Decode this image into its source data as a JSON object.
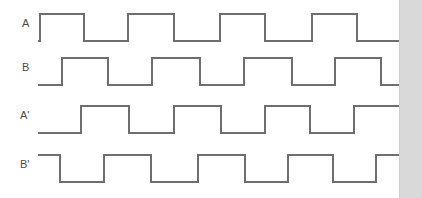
{
  "figure": {
    "type": "timing-diagram",
    "width": 422,
    "height": 198,
    "background_color": "#ffffff",
    "trace_color": "#6e6e6e",
    "label_color": "#4a4a4a",
    "right_strip_color": "#d9d9d9"
  },
  "labels": {
    "a": "A",
    "b": "B",
    "a_prime": "A'",
    "b_prime": "B'"
  },
  "chart_data": {
    "type": "line",
    "title": "",
    "xlabel": "",
    "ylabel": "",
    "grid": false,
    "legend": "none",
    "x_range": [
      38,
      403
    ],
    "signals": [
      {
        "name": "A",
        "label": "A",
        "row": 0,
        "baseline_y": 41,
        "high_y": 14,
        "start_level": "low",
        "end_level": "low",
        "transitions": [
          40,
          84,
          128,
          174,
          220,
          265,
          312,
          357
        ],
        "pulses": [
          [
            40,
            84
          ],
          [
            128,
            174
          ],
          [
            220,
            265
          ],
          [
            312,
            357
          ]
        ]
      },
      {
        "name": "B",
        "label": "B",
        "row": 1,
        "baseline_y": 85,
        "high_y": 58,
        "start_level": "low",
        "end_level": "low",
        "transitions": [
          62,
          108,
          152,
          200,
          244,
          292,
          335,
          381
        ],
        "pulses": [
          [
            62,
            108
          ],
          [
            152,
            200
          ],
          [
            244,
            292
          ],
          [
            335,
            381
          ]
        ]
      },
      {
        "name": "A'",
        "label": "A'",
        "row": 2,
        "baseline_y": 133,
        "high_y": 106,
        "start_level": "low",
        "end_level": "high",
        "transitions": [
          81,
          129,
          174,
          221,
          265,
          310,
          354
        ],
        "pulses": [
          [
            81,
            129
          ],
          [
            174,
            221
          ],
          [
            265,
            310
          ],
          [
            354,
            403
          ]
        ]
      },
      {
        "name": "B'",
        "label": "B'",
        "row": 3,
        "baseline_y": 182,
        "high_y": 155,
        "start_level": "high",
        "end_level": "high",
        "transitions": [
          60,
          104,
          151,
          198,
          245,
          288,
          333,
          376
        ],
        "pulses": [
          [
            38,
            60
          ],
          [
            104,
            151
          ],
          [
            198,
            245
          ],
          [
            288,
            333
          ],
          [
            376,
            403
          ]
        ]
      }
    ]
  }
}
